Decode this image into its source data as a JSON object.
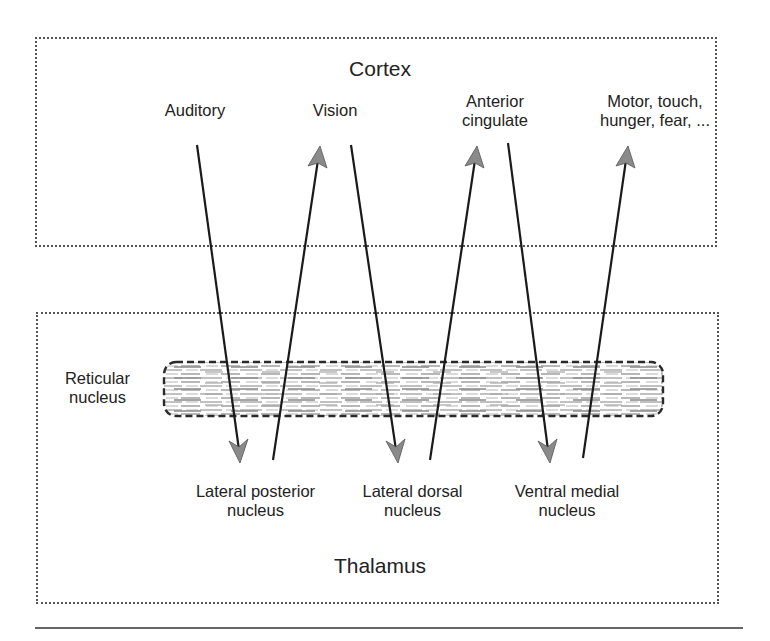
{
  "cortex": {
    "title": "Cortex",
    "areas": [
      {
        "id": "auditory",
        "lines": [
          "Auditory"
        ]
      },
      {
        "id": "vision",
        "lines": [
          "Vision"
        ]
      },
      {
        "id": "anterior-cingulate",
        "lines": [
          "Anterior",
          "cingulate"
        ]
      },
      {
        "id": "motor",
        "lines": [
          "Motor, touch,",
          "hunger, fear, ..."
        ]
      }
    ]
  },
  "thalamus": {
    "title": "Thalamus",
    "reticular": {
      "lines": [
        "Reticular",
        "nucleus"
      ]
    },
    "nuclei": [
      {
        "id": "lateral-posterior",
        "lines": [
          "Lateral posterior",
          "nucleus"
        ]
      },
      {
        "id": "lateral-dorsal",
        "lines": [
          "Lateral dorsal",
          "nucleus"
        ]
      },
      {
        "id": "ventral-medial",
        "lines": [
          "Ventral medial",
          "nucleus"
        ]
      }
    ]
  },
  "connections": [
    {
      "from": "Auditory",
      "to": "Lateral posterior nucleus",
      "direction": "down"
    },
    {
      "from": "Lateral posterior nucleus",
      "to": "Vision",
      "direction": "up"
    },
    {
      "from": "Vision",
      "to": "Lateral dorsal nucleus",
      "direction": "down"
    },
    {
      "from": "Lateral dorsal nucleus",
      "to": "Anterior cingulate",
      "direction": "up"
    },
    {
      "from": "Anterior cingulate",
      "to": "Ventral medial nucleus",
      "direction": "down"
    },
    {
      "from": "Ventral medial nucleus",
      "to": "Motor, touch, hunger, fear, ...",
      "direction": "up"
    }
  ],
  "colors": {
    "line": "#1a1a1a",
    "arrowhead": "#8a8a8a",
    "border": "#555555",
    "hatch": "#9a9a9a"
  }
}
